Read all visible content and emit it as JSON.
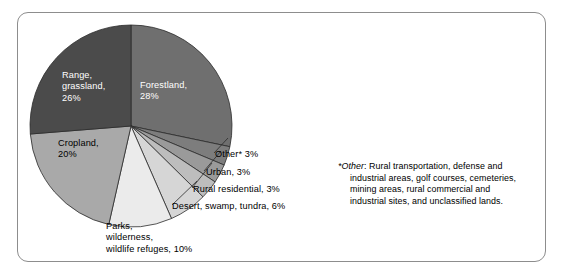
{
  "figure": {
    "frame_color": "#8d8d8d",
    "background": "#ffffff"
  },
  "chart_data": {
    "type": "pie",
    "title": "",
    "xlabel": "",
    "ylabel": "",
    "units": "percent",
    "start_angle_deg": 0,
    "direction": "clockwise",
    "categories": [
      "Forestland",
      "Other*",
      "Urban",
      "Rural residential",
      "Desert, swamp, tundra",
      "Parks, wilderness, wildlife refuges",
      "Cropland",
      "Range, grassland"
    ],
    "values": [
      28,
      3,
      3,
      3,
      6,
      10,
      20,
      26
    ],
    "colors": [
      "#6f6f6f",
      "#7d7d7d",
      "#9a9a9a",
      "#bdbdbd",
      "#d6d6d6",
      "#ebebeb",
      "#a9a9a9",
      "#4b4b4b"
    ],
    "slice_label_text": [
      "Forestland,\n28%",
      "Other* 3%",
      "Urban, 3%",
      "Rural residential, 3%",
      "Desert, swamp, tundra, 6%",
      "Parks,\nwilderness,\nwildlife refuges, 10%",
      "Cropland,\n20%",
      "Range,\ngrassland,\n26%"
    ],
    "label_placement": [
      "inside",
      "outside",
      "outside",
      "outside",
      "outside",
      "outside",
      "inside",
      "inside"
    ],
    "legend": "none",
    "grid": false
  },
  "labels": {
    "range_grassland": "Range,\ngrassland,\n26%",
    "forestland": "Forestland,\n28%",
    "cropland": "Cropland,\n20%",
    "parks": "Parks,\nwilderness,\nwildlife refuges, 10%",
    "other": "Other* 3%",
    "urban": "Urban, 3%",
    "rural_residential": "Rural residential, 3%",
    "desert": "Desert, swamp, tundra, 6%"
  },
  "footnote": {
    "marker": "*",
    "term": "Other",
    "colon": ":",
    "line1": " Rural transportation, defense and",
    "line2": "industrial areas, golf courses, cemeteries,",
    "line3": "mining areas, rural commercial and",
    "line4": "industrial sites, and unclassified lands."
  }
}
